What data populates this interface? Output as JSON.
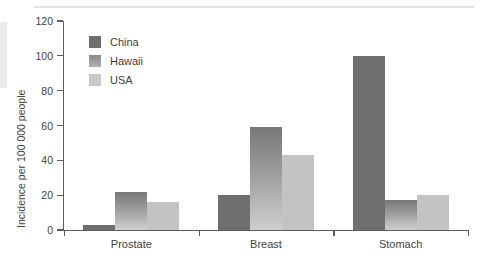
{
  "chart_data": {
    "type": "bar",
    "title": "",
    "xlabel": "",
    "ylabel": "Incidence per 100 000 people",
    "categories": [
      "Prostate",
      "Breast",
      "Stomach"
    ],
    "series": [
      {
        "name": "China",
        "color": "#6f6f6f",
        "values": [
          3,
          20,
          100
        ]
      },
      {
        "name": "Hawaii",
        "color": "#9d9d9d",
        "values": [
          22,
          59,
          17
        ]
      },
      {
        "name": "USA",
        "color": "#c3c3c3",
        "values": [
          16,
          43,
          20
        ]
      }
    ],
    "ylim": [
      0,
      120
    ],
    "yticks": [
      0,
      20,
      40,
      60,
      80,
      100,
      120
    ],
    "ytick_labels": [
      "0",
      "20",
      "40",
      "60",
      "80",
      "100",
      "120"
    ],
    "grid": false,
    "legend_position": "top-left"
  },
  "legend": {
    "items": [
      {
        "label": "China"
      },
      {
        "label": "Hawaii"
      },
      {
        "label": "USA"
      }
    ]
  },
  "axes": {
    "y_title": "Incidence per 100 000 people",
    "y_labels": [
      "120",
      "100",
      "80",
      "60",
      "40",
      "20",
      "0"
    ],
    "x_labels": [
      "Prostate",
      "Breast",
      "Stomach"
    ]
  }
}
